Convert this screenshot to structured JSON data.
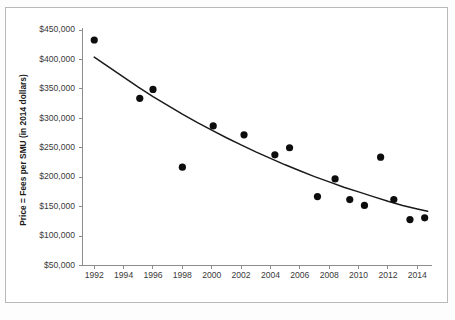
{
  "chart_data": {
    "type": "scatter",
    "title": "",
    "xlabel": "",
    "ylabel": "Price = Fees per SMU (in 2014 dollars)",
    "xlim": [
      1991.2,
      2015.0
    ],
    "ylim": [
      50000,
      450000
    ],
    "grid": false,
    "legend": null,
    "x_tick_labels": [
      "1992",
      "1994",
      "1996",
      "1998",
      "2000",
      "2002",
      "2004",
      "2006",
      "2008",
      "2010",
      "2012",
      "2014"
    ],
    "x_tick_values": [
      1992,
      1994,
      1996,
      1998,
      2000,
      2002,
      2004,
      2006,
      2008,
      2010,
      2012,
      2014
    ],
    "y_tick_labels": [
      "$450,000",
      "$400,000",
      "$350,000",
      "$300,000",
      "$250,000",
      "$200,000",
      "$150,000",
      "$100,000",
      "$50,000"
    ],
    "y_tick_values": [
      450000,
      400000,
      350000,
      300000,
      250000,
      200000,
      150000,
      100000,
      50000
    ],
    "series": [
      {
        "name": "Price per SMU",
        "type": "scatter",
        "marker": "filled-circle",
        "color": "#0d0d0d",
        "points": [
          {
            "x": 1992.0,
            "y": 433000
          },
          {
            "x": 1995.1,
            "y": 334000
          },
          {
            "x": 1996.0,
            "y": 349000
          },
          {
            "x": 1998.0,
            "y": 217000
          },
          {
            "x": 2000.1,
            "y": 287000
          },
          {
            "x": 2002.2,
            "y": 272000
          },
          {
            "x": 2004.3,
            "y": 238000
          },
          {
            "x": 2005.3,
            "y": 250000
          },
          {
            "x": 2007.2,
            "y": 167000
          },
          {
            "x": 2008.4,
            "y": 197000
          },
          {
            "x": 2009.4,
            "y": 162000
          },
          {
            "x": 2010.4,
            "y": 152000
          },
          {
            "x": 2011.5,
            "y": 234000
          },
          {
            "x": 2012.4,
            "y": 162000
          },
          {
            "x": 2013.5,
            "y": 128000
          },
          {
            "x": 2014.5,
            "y": 131000
          }
        ]
      },
      {
        "name": "Trend line",
        "type": "line",
        "color": "#1a1a1a",
        "points": [
          {
            "x": 1992.0,
            "y": 404000
          },
          {
            "x": 1993.0,
            "y": 387000
          },
          {
            "x": 1994.0,
            "y": 370000
          },
          {
            "x": 1995.0,
            "y": 353000
          },
          {
            "x": 1996.0,
            "y": 337000
          },
          {
            "x": 1997.0,
            "y": 322000
          },
          {
            "x": 1998.0,
            "y": 307000
          },
          {
            "x": 1999.0,
            "y": 293000
          },
          {
            "x": 2000.0,
            "y": 280000
          },
          {
            "x": 2001.0,
            "y": 267000
          },
          {
            "x": 2002.0,
            "y": 255000
          },
          {
            "x": 2003.0,
            "y": 243000
          },
          {
            "x": 2004.0,
            "y": 232000
          },
          {
            "x": 2005.0,
            "y": 221000
          },
          {
            "x": 2006.0,
            "y": 211000
          },
          {
            "x": 2007.0,
            "y": 201000
          },
          {
            "x": 2008.0,
            "y": 192000
          },
          {
            "x": 2009.0,
            "y": 183000
          },
          {
            "x": 2010.0,
            "y": 175000
          },
          {
            "x": 2011.0,
            "y": 167000
          },
          {
            "x": 2012.0,
            "y": 159000
          },
          {
            "x": 2013.0,
            "y": 152000
          },
          {
            "x": 2014.0,
            "y": 146000
          },
          {
            "x": 2014.7,
            "y": 142000
          }
        ]
      }
    ]
  }
}
